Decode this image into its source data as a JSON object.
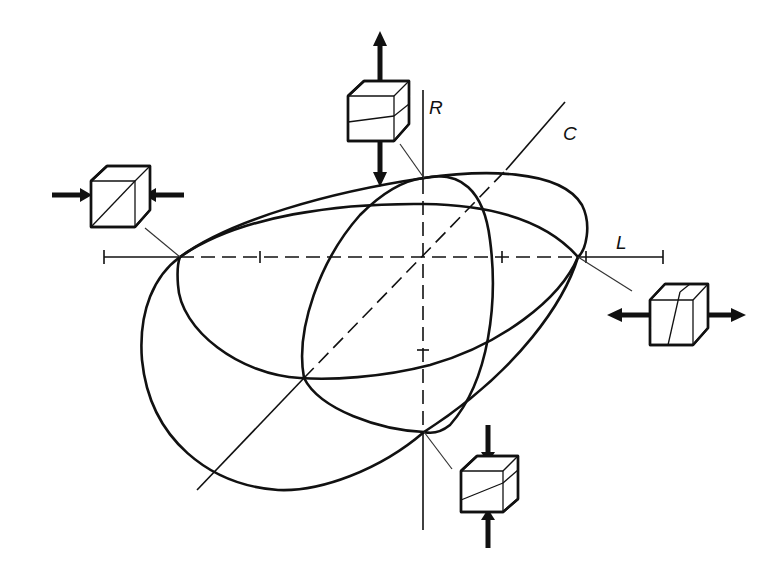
{
  "diagram": {
    "title": "",
    "axes": {
      "horizontal": {
        "label": "L"
      },
      "vertical": {
        "label": "R"
      },
      "diagonal": {
        "label": "C"
      }
    },
    "curves": [
      {
        "name": "outer-envelope",
        "description": "large closed curve through the four loading points"
      },
      {
        "name": "horizontal-ellipse",
        "description": "tilted ellipse elongated along L axis"
      },
      {
        "name": "vertical-ellipse",
        "description": "tilted ellipse elongated along R/C direction"
      }
    ],
    "specimens": [
      {
        "position": "left",
        "loading": "compression (horizontal, arrows pointing inward)",
        "shear_line": "diagonal"
      },
      {
        "position": "top",
        "loading": "tension (vertical, arrows pointing outward)",
        "shear_line": "slightly inclined"
      },
      {
        "position": "right",
        "loading": "tension (horizontal, arrows pointing outward)",
        "shear_line": "steep inclined"
      },
      {
        "position": "bottom",
        "loading": "compression (vertical, arrows pointing inward)",
        "shear_line": "inclined"
      }
    ],
    "colors": {
      "ink": "#111111",
      "background": "#ffffff"
    }
  }
}
